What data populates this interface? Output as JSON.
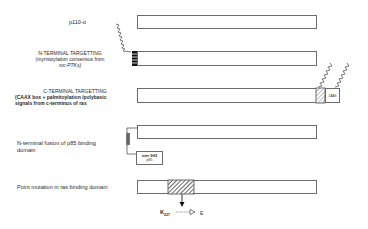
{
  "rows": [
    {
      "id": "p110",
      "label": "p110-α"
    },
    {
      "id": "nterm",
      "title": "N-TERMINAL TARGETTING",
      "desc_line1": "(myristoylation consensus from",
      "desc_line2": "src-PTKs)"
    },
    {
      "id": "cterm",
      "title": "C-TERMINAL TARGETTING",
      "desc_line1": "(CAAX box + palmitoylation /polybasic",
      "desc_line2": "signals from c-terminus of ras",
      "box_label": "CAAX"
    },
    {
      "id": "p85fusion",
      "label_line1": "N-terminal fusion of p85 binding",
      "label_line2": "domain",
      "box_label_line1": "inter SH2",
      "box_label_line2": "p85"
    },
    {
      "id": "pointmut",
      "label": "Point mutation in ras binding domain",
      "mutation_from": "K",
      "mutation_pos": "227",
      "mutation_to": "E"
    }
  ],
  "colors": {
    "outline": "#6b6b6b",
    "hatch": "#333333",
    "text": "#2a2a2a"
  }
}
